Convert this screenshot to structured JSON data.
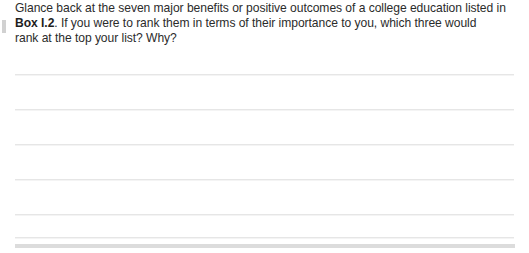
{
  "page": {
    "background_color": "#ffffff",
    "text_color": "#2b2b2b",
    "rule_color": "#e6e6e6",
    "footer_bar_color": "#dcdcdc"
  },
  "prompt": {
    "line1": "Glance back at the seven major benefits or positive outcomes of a college education listed in",
    "line2_bold": "Box I.2",
    "line2_rest": ". If you were to rank them in terms of their importance to you, which three would",
    "line3": "rank at the top your list? Why?"
  },
  "answer_area": {
    "rule_count": 6,
    "rules": [
      {
        "y": 74
      },
      {
        "y": 109
      },
      {
        "y": 144
      },
      {
        "y": 179
      },
      {
        "y": 214
      },
      {
        "y": 237
      }
    ],
    "footer_bar": {
      "y": 244,
      "height": 4
    }
  }
}
